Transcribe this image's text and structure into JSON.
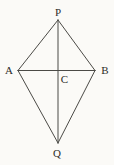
{
  "figure": {
    "colors": {
      "paper": "#fbfaf7",
      "line_ink": "#4b4a46",
      "label_ink": "#2d2c29"
    },
    "vertices": {
      "P": {
        "x": 58,
        "y": 20
      },
      "A": {
        "x": 18,
        "y": 70.5
      },
      "B": {
        "x": 95,
        "y": 70.5
      },
      "Q": {
        "x": 58,
        "y": 143
      },
      "C": {
        "x": 58,
        "y": 70.5
      }
    },
    "edges": [
      {
        "name": "edge-pa",
        "from": "P",
        "to": "A"
      },
      {
        "name": "edge-pb",
        "from": "P",
        "to": "B"
      },
      {
        "name": "edge-aq",
        "from": "A",
        "to": "Q"
      },
      {
        "name": "edge-bq",
        "from": "B",
        "to": "Q"
      },
      {
        "name": "diagonal-ab",
        "from": "A",
        "to": "B"
      },
      {
        "name": "diagonal-pq",
        "from": "P",
        "to": "Q"
      }
    ],
    "labels": {
      "P": {
        "text": "P",
        "x": 58,
        "y": 16
      },
      "A": {
        "text": "A",
        "x": 9,
        "y": 74
      },
      "B": {
        "text": "B",
        "x": 105,
        "y": 74
      },
      "C": {
        "text": "C",
        "x": 64.5,
        "y": 83
      },
      "Q": {
        "text": "Q",
        "x": 57,
        "y": 157
      }
    }
  }
}
